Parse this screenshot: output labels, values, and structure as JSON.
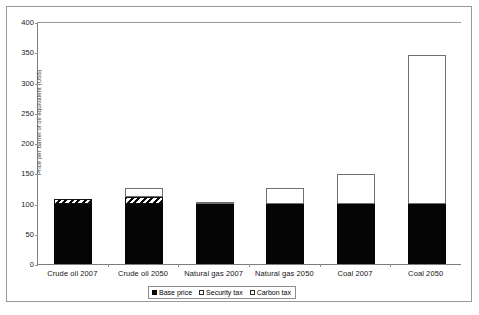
{
  "chart_data": {
    "type": "bar",
    "stacked": true,
    "title": "",
    "subtitle": "",
    "xlabel": "",
    "ylabel": "",
    "ylim": [
      0,
      400
    ],
    "ytick_step": 50,
    "grid": false,
    "legend_position": "bottom-center",
    "categories": [
      "Crude oil 2007",
      "Crude oil 2050",
      "Natural gas 2007",
      "Natural gas 2050",
      "Coal 2007",
      "Coal 2050"
    ],
    "ytick_labels": [
      "400",
      "350",
      "300",
      "250",
      "200",
      "150",
      "100",
      "50",
      "0"
    ],
    "ytick_values": [
      400,
      350,
      300,
      250,
      200,
      150,
      100,
      50,
      0
    ],
    "series": [
      {
        "name": "Base price",
        "pattern": "solid-black",
        "color": "#050505",
        "values": [
          100,
          100,
          100,
          100,
          100,
          100
        ]
      },
      {
        "name": "Security tax",
        "pattern": "diagonal-hatch",
        "color": "#ffffff",
        "values": [
          8,
          10,
          0,
          0,
          0,
          0
        ]
      },
      {
        "name": "Carbon tax",
        "pattern": "open-white",
        "color": "#ffffff",
        "values": [
          0,
          15,
          3,
          25,
          48,
          245
        ]
      }
    ],
    "totals": [
      108,
      125,
      103,
      125,
      148,
      345
    ]
  },
  "axis": {
    "y_title": "Price per barrel of oil equivalent (US$)"
  },
  "legend": {
    "items": [
      {
        "label": "Base price"
      },
      {
        "label": "Security tax"
      },
      {
        "label": "Carbon tax"
      }
    ]
  }
}
